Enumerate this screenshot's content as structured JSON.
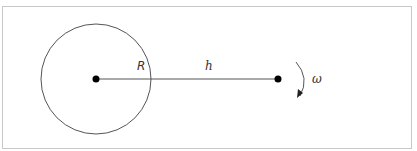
{
  "diagram": {
    "type": "orbit-schematic",
    "labels": {
      "radius": "R",
      "distance": "h",
      "angular_velocity": "ω"
    },
    "colors": {
      "frame": "#c8c8c8",
      "circle": "#555555",
      "line": "#555555",
      "dot": "#000000",
      "text": "#333333"
    }
  }
}
